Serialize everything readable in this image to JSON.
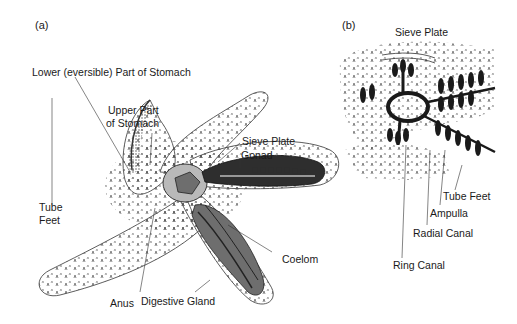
{
  "panels": {
    "a": {
      "label": "(a)",
      "labels": {
        "lower_stomach": "Lower (eversible) Part of Stomach",
        "upper_stomach_1": "Upper Part",
        "upper_stomach_2": "of Stomach",
        "sieve_plate": "Sieve Plate",
        "gonad": "Gonad",
        "tube_feet_1": "Tube",
        "tube_feet_2": "Feet",
        "coelom": "Coelom",
        "anus": "Anus",
        "digestive_gland": "Digestive Gland"
      }
    },
    "b": {
      "label": "(b)",
      "labels": {
        "sieve_plate": "Sieve Plate",
        "tube_feet": "Tube Feet",
        "ampulla": "Ampulla",
        "radial_canal": "Radial Canal",
        "ring_canal": "Ring Canal"
      }
    }
  },
  "colors": {
    "ink": "#1a1a1a",
    "dark_organ": "#2e2e2e",
    "mid_organ": "#6e6e6e",
    "light_fill": "#b9b9b9",
    "background": "#ffffff"
  }
}
